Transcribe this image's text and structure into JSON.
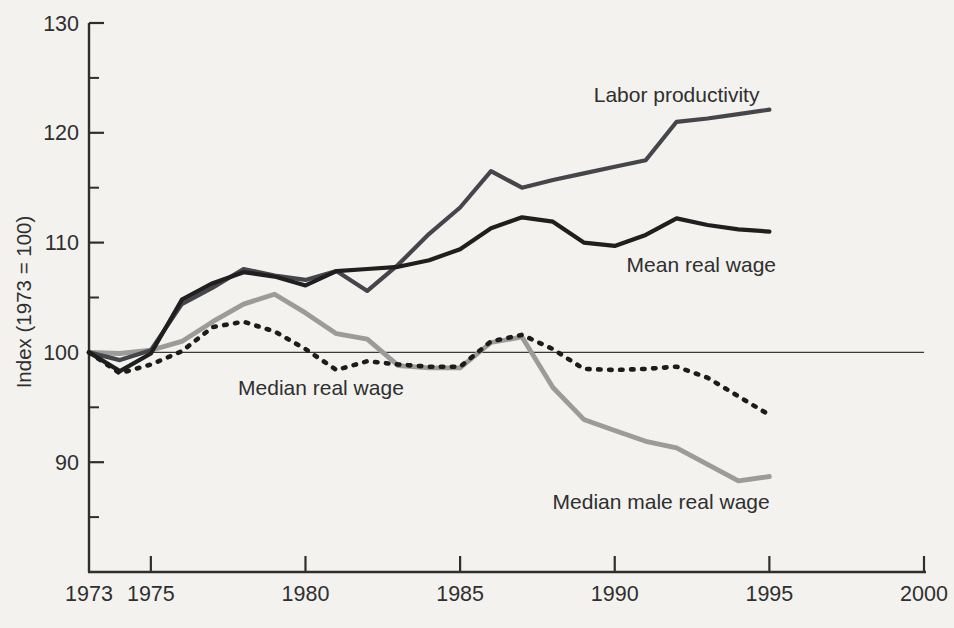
{
  "figure": {
    "background_color": "#f3f2ee",
    "text_color": "#2f2f2f",
    "axis_color": "#2e2e2e"
  },
  "chart_data": {
    "type": "line",
    "title": "",
    "xlabel": "",
    "ylabel": "Index (1973 = 100)",
    "xlim": [
      1973,
      2000
    ],
    "ylim": [
      80,
      130
    ],
    "grid": false,
    "reference_line_y": 100,
    "x_tick_labels": [
      "1973",
      "1975",
      "1980",
      "1985",
      "1990",
      "1995",
      "2000"
    ],
    "x_tick_values": [
      1973,
      1975,
      1980,
      1985,
      1990,
      1995,
      2000
    ],
    "x_ticks_with_marks": [
      1975,
      1980,
      1985,
      1990,
      1995,
      2000
    ],
    "y_tick_labels": [
      "90",
      "100",
      "110",
      "120",
      "130"
    ],
    "y_tick_values": [
      90,
      100,
      110,
      120,
      130
    ],
    "y_minor_tick_values": [
      85,
      95,
      105,
      115,
      125
    ],
    "legend_position": "inline-labels",
    "x": [
      1973,
      1974,
      1975,
      1976,
      1977,
      1978,
      1979,
      1980,
      1981,
      1982,
      1983,
      1984,
      1985,
      1986,
      1987,
      1988,
      1989,
      1990,
      1991,
      1992,
      1993,
      1994,
      1995
    ],
    "series": [
      {
        "name": "Labor productivity",
        "color": "#45454c",
        "style": "solid",
        "stroke_width": 4.2,
        "values": [
          100,
          99.3,
          100.2,
          104.4,
          105.9,
          107.6,
          107.0,
          106.6,
          107.4,
          105.6,
          108.0,
          110.8,
          113.2,
          116.5,
          115.0,
          115.7,
          116.3,
          116.9,
          117.5,
          121.0,
          121.3,
          121.7,
          122.1
        ],
        "label_anchor": {
          "x": 1992.0,
          "y": 123.4
        }
      },
      {
        "name": "Mean real wage",
        "color": "#1f1f1f",
        "style": "solid",
        "stroke_width": 4.2,
        "values": [
          100,
          98.3,
          99.9,
          104.8,
          106.3,
          107.3,
          106.9,
          106.1,
          107.4,
          107.6,
          107.8,
          108.4,
          109.4,
          111.3,
          112.3,
          111.9,
          110.0,
          109.7,
          110.7,
          112.2,
          111.6,
          111.2,
          111.0
        ],
        "label_anchor": {
          "x": 1992.8,
          "y": 108.0
        }
      },
      {
        "name": "Median real wage",
        "color": "#1c1c1c",
        "style": "dotted",
        "stroke_width": 4.6,
        "values": [
          100,
          98.1,
          98.9,
          100.1,
          102.3,
          102.8,
          101.9,
          100.3,
          98.4,
          99.2,
          98.9,
          98.7,
          98.7,
          101.0,
          101.6,
          100.3,
          98.5,
          98.4,
          98.5,
          98.7,
          97.7,
          96.0,
          94.3
        ],
        "label_anchor": {
          "x": 1980.5,
          "y": 96.8
        }
      },
      {
        "name": "Median male real wage",
        "color": "#9b9b99",
        "style": "solid",
        "stroke_width": 4.8,
        "values": [
          100,
          99.9,
          100.2,
          101.0,
          102.8,
          104.4,
          105.3,
          103.6,
          101.7,
          101.2,
          98.8,
          98.6,
          98.6,
          100.9,
          101.4,
          96.8,
          93.9,
          92.9,
          91.9,
          91.3,
          89.8,
          88.3,
          88.7
        ],
        "label_anchor": {
          "x": 1991.5,
          "y": 86.4
        }
      }
    ]
  }
}
